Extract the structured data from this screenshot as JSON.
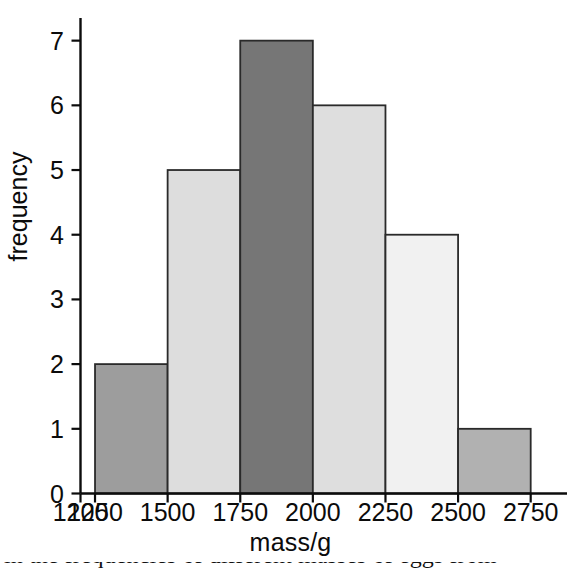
{
  "chart_data": {
    "type": "bar",
    "title": "",
    "xlabel": "mass/g",
    "ylabel": "frequency",
    "categories": [
      "1250-1500",
      "1500-1750",
      "1750-2000",
      "2000-2250",
      "2250-2500",
      "2500-2750"
    ],
    "bin_edges": [
      1250,
      1500,
      1750,
      2000,
      2250,
      2500,
      2750
    ],
    "values": [
      2,
      5,
      7,
      6,
      4,
      1
    ],
    "bar_colors": [
      "#9d9d9d",
      "#dddddd",
      "#767676",
      "#dedede",
      "#f1f1f1",
      "#b1b1b1"
    ],
    "bar_edge_color": "#2a2a2a",
    "xlim": [
      1200,
      2875
    ],
    "ylim": [
      0,
      7.35
    ],
    "xticks": [
      1200,
      1250,
      1500,
      1750,
      2000,
      2250,
      2500,
      2750
    ],
    "xtick_labels": [
      "1200",
      "1250",
      "1500",
      "1750",
      "2000",
      "2250",
      "2500",
      "2750"
    ],
    "yticks": [
      0,
      1,
      2,
      3,
      4,
      5,
      6,
      7
    ],
    "ytick_labels": [
      "0",
      "1",
      "2",
      "3",
      "4",
      "5",
      "6",
      "7"
    ],
    "grid": false,
    "legend": null,
    "axis_color": "#000000"
  },
  "axes": {
    "x_axis_title": "mass/g",
    "y_axis_title": "frequency"
  },
  "caption": {
    "cut_text": "in the frequencies of different masses of eggs from"
  }
}
